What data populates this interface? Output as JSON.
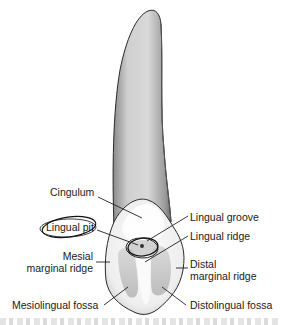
{
  "figure": {
    "colors": {
      "outline": "#2b2b2b",
      "root_fill": "#c9c9c9",
      "crown_fill": "#f2f2f2",
      "fossa_fill": "#bdbdbd",
      "leader_line": "#222222",
      "text": "#1a1a1a"
    }
  },
  "labels": {
    "cingulum": "Cingulum",
    "lingual_pit": "Lingual pit",
    "lingual_groove": "Lingual groove",
    "lingual_ridge": "Lingual ridge",
    "mesial_marginal_ridge_line1": "Mesial",
    "mesial_marginal_ridge_line2": "marginal ridge",
    "distal_marginal_ridge_line1": "Distal",
    "distal_marginal_ridge_line2": "marginal ridge",
    "mesiolingual_fossa": "Mesiolingual fossa",
    "distolingual_fossa": "Distolingual fossa"
  }
}
